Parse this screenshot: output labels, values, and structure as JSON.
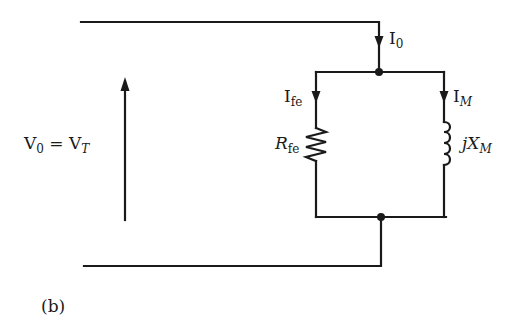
{
  "figure": {
    "caption": "(b)",
    "type": "equivalent-circuit-no-load",
    "colors": {
      "wire": "#1a1a1a",
      "background": "#ffffff"
    }
  },
  "labels": {
    "voltage": {
      "main": "V",
      "sub0": "0",
      "eq": " = ",
      "main2": "V",
      "sub2": "T"
    },
    "i0": {
      "main": "I",
      "sub": "0"
    },
    "ife": {
      "main": "I",
      "sub": "fe"
    },
    "im": {
      "main": "I",
      "sub": "M"
    },
    "rfe": {
      "main": "R",
      "sub": "fe"
    },
    "xm": {
      "prefix": "jX",
      "sub": "M"
    }
  },
  "components": [
    {
      "id": "Rfe",
      "kind": "resistor",
      "branch": "left"
    },
    {
      "id": "jXM",
      "kind": "inductor",
      "branch": "right"
    }
  ]
}
